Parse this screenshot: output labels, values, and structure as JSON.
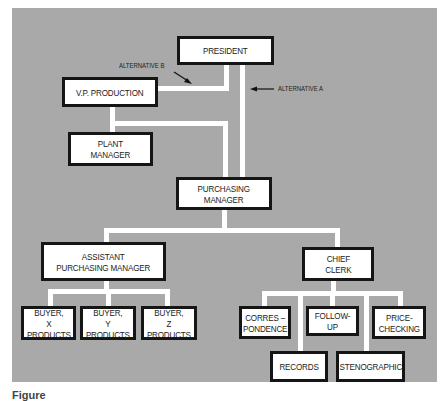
{
  "diagram": {
    "type": "organization-chart",
    "nodes": {
      "president": "PRESIDENT",
      "vp_production": "V.P. PRODUCTION",
      "plant_manager": "PLANT\nMANAGER",
      "purchasing_manager": "PURCHASING\nMANAGER",
      "assistant_purchasing_manager": "ASSISTANT\nPURCHASING MANAGER",
      "chief_clerk": "CHIEF\nCLERK",
      "buyer_x": "BUYER,\nX PRODUCTS",
      "buyer_y": "BUYER,\nY PRODUCTS",
      "buyer_z": "BUYER,\nZ PRODUCTS",
      "correspondence": "CORRES –\nPONDENCE",
      "follow_up": "FOLLOW-UP",
      "price_checking": "PRICE-\nCHECKING",
      "records": "RECORDS",
      "stenographic": "STENOGRAPHIC"
    },
    "annotations": {
      "alternative_a": "ALTERNATIVE A",
      "alternative_b": "ALTERNATIVE B"
    },
    "edges": [
      {
        "from": "president",
        "to": "vp_production"
      },
      {
        "from": "president",
        "to": "purchasing_manager",
        "label": "ALTERNATIVE A"
      },
      {
        "from": "vp_production",
        "to": "purchasing_manager",
        "label": "ALTERNATIVE B"
      },
      {
        "from": "vp_production",
        "to": "plant_manager"
      },
      {
        "from": "purchasing_manager",
        "to": "assistant_purchasing_manager"
      },
      {
        "from": "purchasing_manager",
        "to": "chief_clerk"
      },
      {
        "from": "assistant_purchasing_manager",
        "to": "buyer_x"
      },
      {
        "from": "assistant_purchasing_manager",
        "to": "buyer_y"
      },
      {
        "from": "assistant_purchasing_manager",
        "to": "buyer_z"
      },
      {
        "from": "chief_clerk",
        "to": "correspondence"
      },
      {
        "from": "chief_clerk",
        "to": "records"
      },
      {
        "from": "chief_clerk",
        "to": "follow_up"
      },
      {
        "from": "chief_clerk",
        "to": "stenographic"
      },
      {
        "from": "chief_clerk",
        "to": "price_checking"
      }
    ],
    "colors": {
      "background": "#a9a9a9",
      "connector": "#ffffff",
      "box_border": "#151515",
      "box_fill": "#ffffff"
    }
  },
  "caption": "Figure"
}
